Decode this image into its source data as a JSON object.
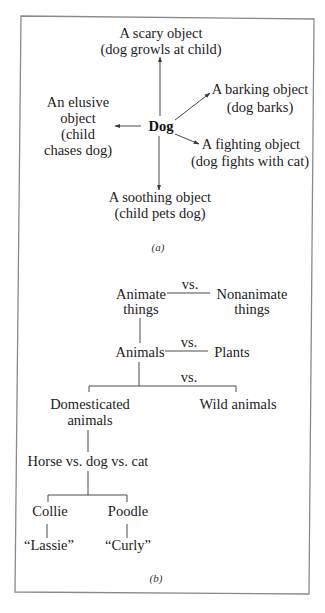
{
  "panel_a": {
    "center": "Dog",
    "top": {
      "line1": "A scary object",
      "line2": "(dog growls at child)"
    },
    "left": {
      "line1": "An elusive",
      "line2": "object",
      "line3": "(child",
      "line4": "chases dog)"
    },
    "upper_right": {
      "line1": "A barking object",
      "line2": "(dog barks)"
    },
    "lower_right": {
      "line1": "A fighting object",
      "line2": "(dog fights with cat)"
    },
    "bottom": {
      "line1": "A soothing object",
      "line2": "(child pets dog)"
    },
    "caption": "(a)"
  },
  "panel_b": {
    "level1": {
      "left_line1": "Animate",
      "left_line2": "things",
      "vs": "vs.",
      "right_line1": "Nonanimate",
      "right_line2": "things"
    },
    "level2": {
      "left": "Animals",
      "vs": "vs.",
      "right": "Plants"
    },
    "level3": {
      "left_line1": "Domesticated",
      "left_line2": "animals",
      "vs": "vs.",
      "right": "Wild animals"
    },
    "level4": {
      "label": "Horse vs. dog vs. cat"
    },
    "level5": {
      "left": "Collie",
      "right": "Poodle"
    },
    "level6": {
      "left": "“Lassie”",
      "right": "“Curly”"
    },
    "caption": "(b)"
  }
}
